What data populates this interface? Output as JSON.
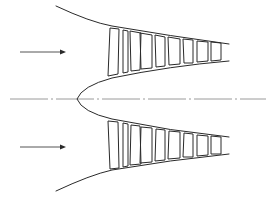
{
  "diagram": {
    "title": "",
    "colors": {
      "line": "#2a2a2a",
      "centerline": "#9a9a9a",
      "arrow": "#555555",
      "background": "#ffffff"
    },
    "components": {
      "outer_casing": {
        "label": ""
      },
      "hub": {
        "label": ""
      },
      "axis": {
        "label": "",
        "style": "dash-dot"
      },
      "flow_arrows": [
        {
          "label": "",
          "position": "upper"
        },
        {
          "label": "",
          "position": "lower"
        }
      ],
      "blade_rows_per_side": 7
    }
  }
}
